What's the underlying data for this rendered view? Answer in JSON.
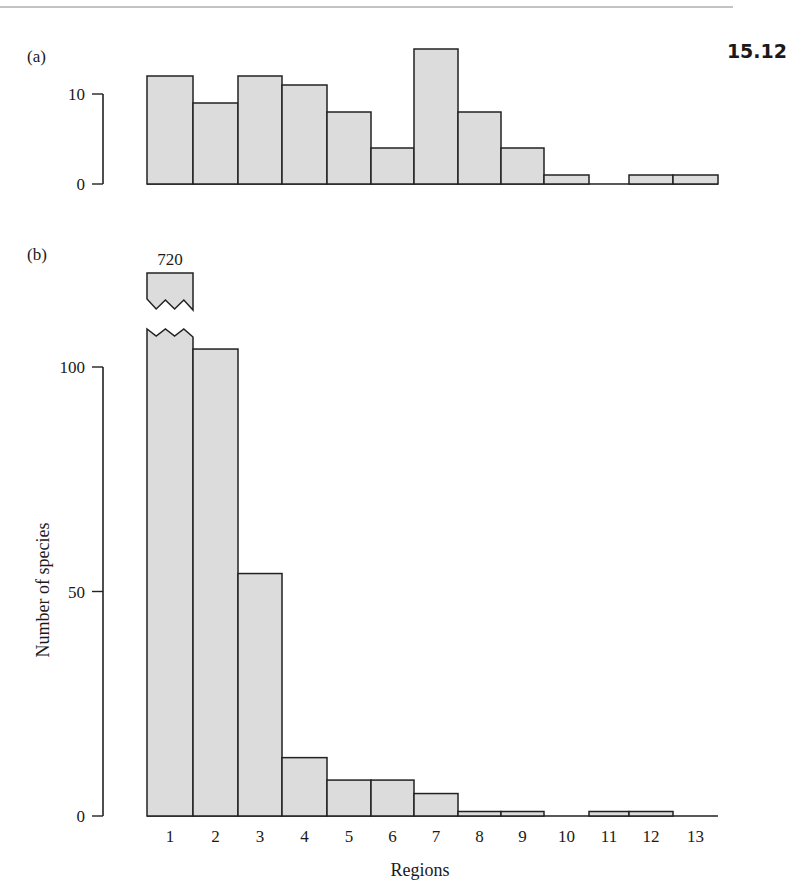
{
  "figure": {
    "number": "15.12",
    "colors": {
      "bar_fill": "#dcdcdc",
      "bar_stroke": "#222222",
      "axis": "#222222",
      "rule": "#888888"
    }
  },
  "chart_data": [
    {
      "type": "bar",
      "panel_label": "(a)",
      "title": "",
      "xlabel": "Regions",
      "ylabel": "Number of species",
      "categories": [
        "1",
        "2",
        "3",
        "4",
        "5",
        "6",
        "7",
        "8",
        "9",
        "10",
        "11",
        "12",
        "13"
      ],
      "values": [
        12,
        9,
        12,
        11,
        8,
        4,
        15,
        8,
        4,
        1,
        0,
        1,
        1
      ],
      "yticks": [
        0,
        10
      ],
      "ylim": [
        0,
        15
      ],
      "grid": false,
      "legend": null
    },
    {
      "type": "bar",
      "panel_label": "(b)",
      "title": "",
      "xlabel": "Regions",
      "ylabel": "Number of species",
      "categories": [
        "1",
        "2",
        "3",
        "4",
        "5",
        "6",
        "7",
        "8",
        "9",
        "10",
        "11",
        "12",
        "13"
      ],
      "values": [
        720,
        104,
        54,
        13,
        8,
        8,
        5,
        1,
        1,
        0,
        1,
        1,
        0
      ],
      "annotations": [
        {
          "category": "1",
          "text": "720",
          "note": "broken bar (axis break)"
        }
      ],
      "yticks": [
        0,
        50,
        100
      ],
      "ylim": [
        0,
        110
      ],
      "grid": false,
      "legend": null
    }
  ]
}
